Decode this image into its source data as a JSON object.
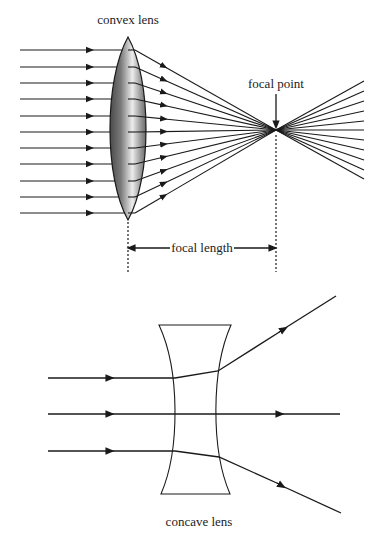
{
  "convex": {
    "title": "convex lens",
    "focal_point_label": "focal point",
    "focal_length_label": "focal length",
    "incoming_rays_y": [
      50,
      67,
      83,
      99,
      116,
      132,
      148,
      164,
      181,
      197,
      213
    ],
    "outgoing_end_y": [
      81,
      91,
      101,
      111,
      121,
      130,
      140,
      150,
      160,
      170,
      179
    ],
    "lens": {
      "cx": 128,
      "top": 37,
      "bottom": 220,
      "half_width": 19
    },
    "focal_point": {
      "x": 276,
      "y": 130
    },
    "colors": {
      "line": "#1a1a1a",
      "lens_dark": "#555555",
      "lens_light": "#e0e0e0"
    }
  },
  "concave": {
    "title": "concave lens",
    "rays": [
      {
        "y_in": 378,
        "kind": "up"
      },
      {
        "y_in": 414,
        "kind": "straight"
      },
      {
        "y_in": 451,
        "kind": "down"
      }
    ]
  }
}
